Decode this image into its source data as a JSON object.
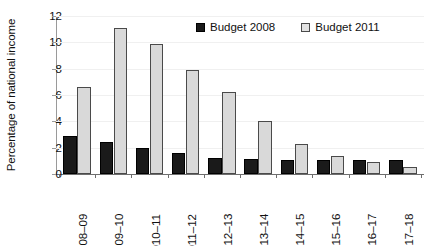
{
  "chart_data": {
    "type": "bar",
    "title": "",
    "xlabel": "",
    "ylabel": "Percentage of national income",
    "ylim": [
      0,
      12
    ],
    "yticks": [
      0,
      2,
      4,
      6,
      8,
      10,
      12
    ],
    "grid": false,
    "legend_position": "top-center",
    "categories": [
      "2008–09",
      "2009–10",
      "2010–11",
      "2011–12",
      "2012–13",
      "2013–14",
      "2014–15",
      "2015–16",
      "2016–17",
      "2017–18"
    ],
    "series": [
      {
        "name": "Budget 2008",
        "color": "#1a1a1a",
        "values": [
          2.9,
          2.4,
          2.0,
          1.6,
          1.25,
          1.15,
          1.1,
          1.1,
          1.05,
          1.05
        ]
      },
      {
        "name": "Budget 2011",
        "color": "#d9d9d9",
        "values": [
          6.6,
          11.1,
          9.9,
          7.9,
          6.2,
          4.0,
          2.3,
          1.35,
          0.9,
          0.5
        ]
      }
    ]
  },
  "colors": {
    "series_2008": "#1a1a1a",
    "series_2011": "#d9d9d9",
    "axis": "#6e6e6e",
    "text": "#111111",
    "background": "#ffffff"
  }
}
